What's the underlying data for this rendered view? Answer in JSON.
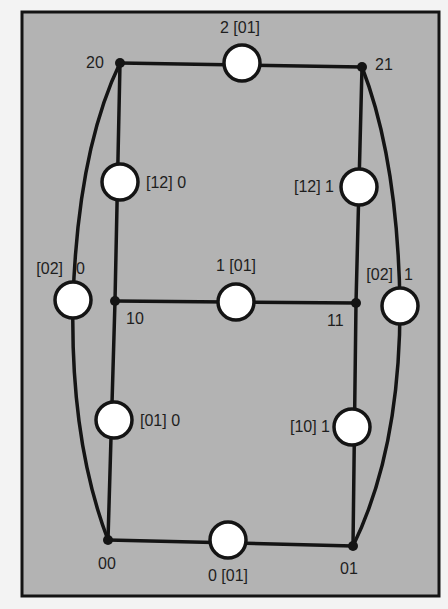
{
  "diagram": {
    "colors": {
      "page_background": "#f3f3f3",
      "panel_background": "#b3b3b3",
      "stroke": "#141414",
      "node_fill": "#141414",
      "circle_fill": "#ffffff",
      "text": "#1e1e1e"
    },
    "vertices": [
      {
        "id": "20",
        "label": "20",
        "x": 120,
        "y": 63
      },
      {
        "id": "21",
        "label": "21",
        "x": 362,
        "y": 67
      },
      {
        "id": "10",
        "label": "10",
        "x": 115,
        "y": 301
      },
      {
        "id": "11",
        "label": "11",
        "x": 356,
        "y": 303
      },
      {
        "id": "00",
        "label": "00",
        "x": 108,
        "y": 540
      },
      {
        "id": "01",
        "label": "01",
        "x": 353,
        "y": 546
      }
    ],
    "edges": [
      {
        "id": "e-20-21",
        "from": "20",
        "to": "21",
        "label": "2 [01]"
      },
      {
        "id": "e-10-11",
        "from": "10",
        "to": "11",
        "label": "1 [01]"
      },
      {
        "id": "e-00-01",
        "from": "00",
        "to": "01",
        "label": "0 [01]"
      },
      {
        "id": "e-20-10",
        "from": "20",
        "to": "10",
        "label": "[12] 0"
      },
      {
        "id": "e-21-11",
        "from": "21",
        "to": "11",
        "label": "[12] 1"
      },
      {
        "id": "e-10-00",
        "from": "10",
        "to": "00",
        "label": "[01] 0"
      },
      {
        "id": "e-11-01",
        "from": "11",
        "to": "01",
        "label": "[10] 1"
      },
      {
        "id": "e-20-00",
        "from": "20",
        "to": "00",
        "label": "[02]  0",
        "curved": true
      },
      {
        "id": "e-21-01",
        "from": "21",
        "to": "01",
        "label": "[02]  1",
        "curved": true
      }
    ],
    "labels": {
      "v20": "20",
      "v21": "21",
      "v10": "10",
      "v11": "11",
      "v00": "00",
      "v01": "01",
      "e_top": "2 [01]",
      "e_mid": "1 [01]",
      "e_bot": "0 [01]",
      "e_left_upper": "[12] 0",
      "e_right_upper": "[12] 1",
      "e_left_lower": "[01] 0",
      "e_right_lower": "[10] 1",
      "e_left_curve_a": "[02]",
      "e_left_curve_b": "0",
      "e_right_curve_a": "[02]",
      "e_right_curve_b": "1"
    }
  }
}
